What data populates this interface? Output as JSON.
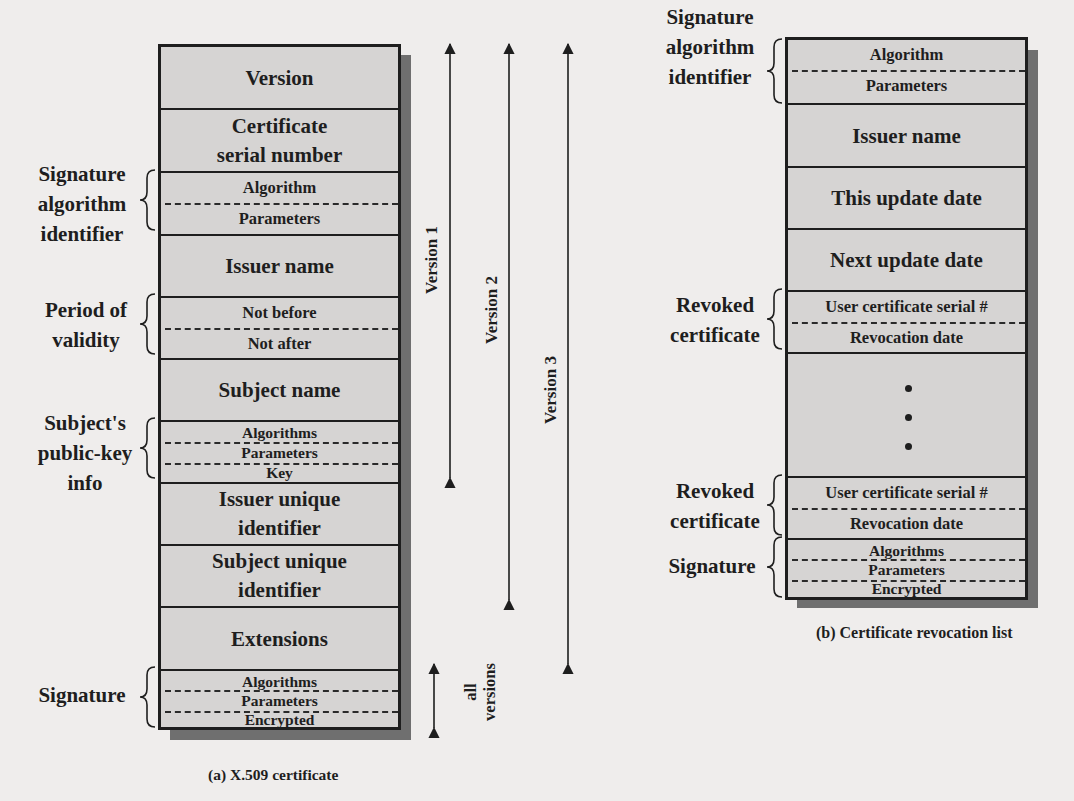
{
  "certificate": {
    "caption": "(a) X.509 certificate",
    "fields": {
      "version": "Version",
      "serial_line1": "Certificate",
      "serial_line2": "serial number",
      "sig_alg_algorithm": "Algorithm",
      "sig_alg_parameters": "Parameters",
      "issuer_name": "Issuer name",
      "not_before": "Not before",
      "not_after": "Not after",
      "subject_name": "Subject name",
      "pk_algorithms": "Algorithms",
      "pk_parameters": "Parameters",
      "pk_key": "Key",
      "issuer_uid_line1": "Issuer unique",
      "issuer_uid_line2": "identifier",
      "subject_uid_line1": "Subject unique",
      "subject_uid_line2": "identifier",
      "extensions": "Extensions",
      "sig_algorithms": "Algorithms",
      "sig_parameters": "Parameters",
      "sig_encrypted": "Encrypted"
    },
    "brace_labels": {
      "sig_alg": [
        "Signature",
        "algorithm",
        "identifier"
      ],
      "validity": [
        "Period of",
        "validity"
      ],
      "public_key": [
        "Subject's",
        "public-key",
        "info"
      ],
      "signature": [
        "Signature"
      ]
    },
    "version_arrows": {
      "v1": "Version 1",
      "v2": "Version 2",
      "v3": "Version 3",
      "all_line1": "all",
      "all_line2": "versions"
    }
  },
  "crl": {
    "caption": "(b) Certificate revocation list",
    "fields": {
      "sig_alg_algorithm": "Algorithm",
      "sig_alg_parameters": "Parameters",
      "issuer_name": "Issuer name",
      "this_update": "This update date",
      "next_update": "Next update date",
      "rev1_serial": "User certificate serial #",
      "rev1_date": "Revocation date",
      "rev2_serial": "User certificate serial #",
      "rev2_date": "Revocation date",
      "sig_algorithms": "Algorithms",
      "sig_parameters": "Parameters",
      "sig_encrypted": "Encrypted"
    },
    "brace_labels": {
      "sig_alg": [
        "Signature",
        "algorithm",
        "identifier"
      ],
      "revoked1": [
        "Revoked",
        "certificate"
      ],
      "revoked2": [
        "Revoked",
        "certificate"
      ],
      "signature": [
        "Signature"
      ]
    },
    "ellipsis": "vertical-dots"
  },
  "colors": {
    "field_fill": "#d6d4d3",
    "border": "#1e1e1e",
    "shadow": "#6f6f6f",
    "background": "#efedec"
  }
}
